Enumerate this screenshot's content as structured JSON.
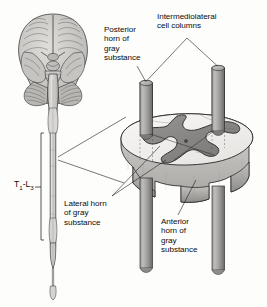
{
  "figure": {
    "view": "inferior view of brain with spinal cord and magnified cord segment block"
  },
  "labels": {
    "posterior_horn": "Posterior\nhorn of\ngray\nsubstance",
    "intermediolateral": "Intermediolateral\ncell columns",
    "lateral_horn": "Lateral horn\nof gray\nsubstance",
    "anterior_horn": "Anterior\nhorn of\ngray\nsubstance",
    "segment_level_prefix": "T",
    "segment_level_sub1": "1",
    "segment_level_dash": "-L",
    "segment_level_sub2": "3"
  },
  "anatomy": {
    "brain": "brain-inferior-view",
    "spinal_cord": "spinal-cord",
    "cord_block": "spinal-cord-segment-block",
    "columns": [
      "intermediolateral-column-posterior-left",
      "intermediolateral-column-posterior-right",
      "intermediolateral-column-anterior-left",
      "intermediolateral-column-anterior-right"
    ],
    "gray_matter": "butterfly-shaped-gray-substance"
  },
  "colors": {
    "background": "#fdfdfc",
    "top_surface": "#f2f0ee",
    "gray_matter": "#8a8a8a",
    "gray_matter_dark": "#767676",
    "column_light": "#b4b4b2",
    "column_dark": "#6e6e6e",
    "side_wall": "#cfcdca",
    "side_wall_dark": "#9c9a97",
    "outline": "#1a1a1a",
    "text": "#0b0b0b",
    "brain_tissue": "#c9c7c4",
    "cord_tissue": "#d8d6d3"
  }
}
